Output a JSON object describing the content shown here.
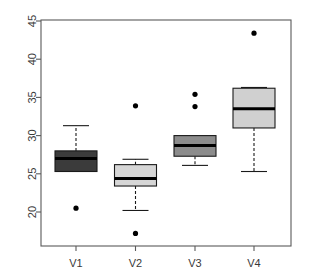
{
  "chart_data": {
    "type": "box",
    "title": "",
    "xlabel": "",
    "ylabel": "",
    "grid": false,
    "legend": "none",
    "ylim": [
      16.5,
      45.5
    ],
    "ytick_labels": [
      "20",
      "25",
      "30",
      "35",
      "40",
      "45"
    ],
    "ytick_values": [
      20,
      25,
      30,
      35,
      40,
      45
    ],
    "categories": [
      "V1",
      "V2",
      "V3",
      "V4"
    ],
    "boxes": [
      {
        "label": "V1",
        "whisker_low": 25.3,
        "q1": 25.3,
        "median": 27.0,
        "q3": 28.0,
        "whisker_high": 31.3,
        "outliers": [
          20.5
        ],
        "fill": "#3b3b3b"
      },
      {
        "label": "V2",
        "whisker_low": 20.2,
        "q1": 23.4,
        "median": 24.4,
        "q3": 26.2,
        "whisker_high": 26.9,
        "outliers": [
          33.9,
          17.2
        ],
        "fill": "#d6d6d6"
      },
      {
        "label": "V3",
        "whisker_low": 26.1,
        "q1": 27.3,
        "median": 28.7,
        "q3": 30.0,
        "whisker_high": 30.0,
        "outliers": [
          35.4,
          33.8
        ],
        "fill": "#8c8c8c"
      },
      {
        "label": "V4",
        "whisker_low": 25.3,
        "q1": 31.0,
        "median": 33.5,
        "q3": 36.2,
        "whisker_high": 36.3,
        "outliers": [
          43.4
        ],
        "fill": "#d0d0d0"
      }
    ],
    "colors": {
      "axis": "#5a5a5a",
      "box_outline": "#1a1a1a",
      "median": "#000000",
      "whisker": "#1a1a1a",
      "outlier": "#000000",
      "background": "#ffffff"
    }
  },
  "yaxis": {
    "labels": [
      "45",
      "40",
      "35",
      "30",
      "25",
      "20"
    ]
  },
  "xaxis": {
    "labels": [
      "V1",
      "V2",
      "V3",
      "V4"
    ]
  }
}
